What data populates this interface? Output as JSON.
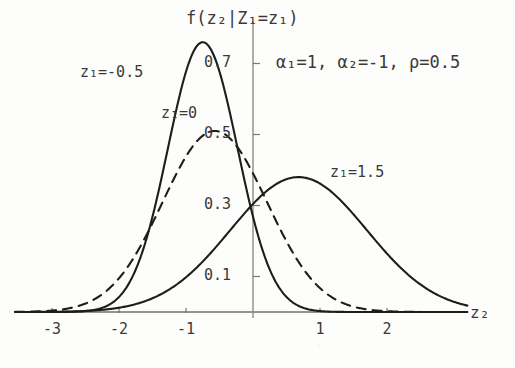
{
  "figure": {
    "y_axis_title": "f(z₂|Z₁=z₁)",
    "x_axis_title": "z₂",
    "annotation": "α₁=1, α₂=-1, ρ=0.5",
    "annotation_parts": {
      "alpha1": "α₁=1,",
      "alpha2": "α₂=-1,",
      "rho": "ρ=0.5"
    },
    "curve_labels": {
      "left": "z₁=-0.5",
      "middle": "z₁=0",
      "right": "z₁=1.5"
    }
  },
  "chart_data": {
    "type": "line",
    "title": "",
    "xlabel": "z₂",
    "ylabel": "f(z₂|Z₁=z₁)",
    "xlim": [
      -3.55,
      3.2
    ],
    "ylim": [
      0,
      0.82
    ],
    "xticks": [
      -3,
      -2,
      -1,
      1,
      2
    ],
    "xticklabels": [
      "-3",
      "-2",
      "-1",
      "1",
      "2"
    ],
    "yticks": [
      0.1,
      0.3,
      0.5,
      0.7
    ],
    "yticklabels": [
      "0.1",
      "0.3",
      "0.5",
      "0.7"
    ],
    "grid": false,
    "legend": "inline-annotations",
    "parameters": {
      "alpha1": 1,
      "alpha2": -1,
      "rho": 0.5
    },
    "series": [
      {
        "name": "z₁=-0.5",
        "style": "solid",
        "color": "#1d1d1b",
        "peak_x": -0.75,
        "peak_y": 0.76,
        "sigma": 0.52,
        "mean": -0.75,
        "amplitude": 0.76
      },
      {
        "name": "z₁=0",
        "style": "dashed",
        "color": "#1d1d1b",
        "peak_x": -0.57,
        "peak_y": 0.51,
        "sigma": 0.78,
        "mean": -0.57,
        "amplitude": 0.51
      },
      {
        "name": "z₁=1.5",
        "style": "solid",
        "color": "#1d1d1b",
        "peak_x": 0.68,
        "peak_y": 0.38,
        "sigma": 1.02,
        "mean": 0.68,
        "amplitude": 0.38
      }
    ]
  },
  "geometry": {
    "origin_x": 253,
    "baseline_y": 312,
    "px_per_x_unit": 67,
    "px_per_y_unit": 355
  }
}
